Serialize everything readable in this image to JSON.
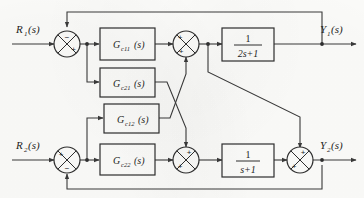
{
  "diagram": {
    "type": "control-block-diagram",
    "inputs": [
      {
        "id": "r1",
        "label": "R",
        "subscript": "1",
        "suffix": "(s)"
      },
      {
        "id": "r2",
        "label": "R",
        "subscript": "2",
        "suffix": "(s)"
      }
    ],
    "outputs": [
      {
        "id": "y1",
        "label": "Y",
        "subscript": "1",
        "suffix": "(s)"
      },
      {
        "id": "y2",
        "label": "Y",
        "subscript": "2",
        "suffix": "(s)"
      }
    ],
    "controller_blocks": [
      {
        "id": "gc11",
        "label": "G",
        "subscript": "c11",
        "suffix": "(s)"
      },
      {
        "id": "gc21",
        "label": "G",
        "subscript": "c21",
        "suffix": "(s)"
      },
      {
        "id": "gc12",
        "label": "G",
        "subscript": "c12",
        "suffix": "(s)"
      },
      {
        "id": "gc22",
        "label": "G",
        "subscript": "c22",
        "suffix": "(s)"
      }
    ],
    "plant_blocks": [
      {
        "id": "plant1",
        "numerator": "1",
        "denominator": "2s+1"
      },
      {
        "id": "plant2",
        "numerator": "1",
        "denominator": "s+1"
      }
    ],
    "summing_junctions": [
      {
        "id": "sum-r1",
        "signs": [
          {
            "position": "top",
            "sign": "−"
          },
          {
            "position": "right-lower",
            "sign": "+"
          }
        ]
      },
      {
        "id": "sum-mid-top",
        "signs": [
          {
            "position": "left-upper",
            "sign": "+"
          },
          {
            "position": "bottom-left",
            "sign": "+"
          }
        ]
      },
      {
        "id": "sum-r2",
        "signs": [
          {
            "position": "left-upper",
            "sign": "+"
          },
          {
            "position": "bottom-right",
            "sign": "−"
          }
        ]
      },
      {
        "id": "sum-mid-bottom",
        "signs": [
          {
            "position": "top-right",
            "sign": "+"
          },
          {
            "position": "left-lower",
            "sign": "+"
          }
        ]
      },
      {
        "id": "sum-out2",
        "signs": [
          {
            "position": "top-right",
            "sign": "+"
          },
          {
            "position": "left-lower",
            "sign": "+"
          }
        ]
      }
    ],
    "colors": {
      "line": "#3a3a3a",
      "block_stroke": "#2e2e2e",
      "block_fill": "#fdfdfb",
      "text": "#1d1d1d",
      "background": "#fdfdfb"
    }
  }
}
